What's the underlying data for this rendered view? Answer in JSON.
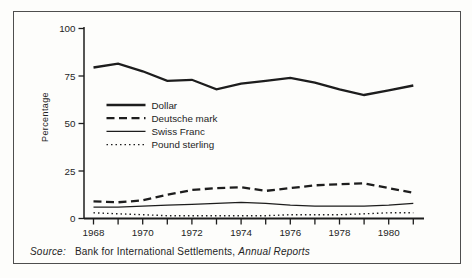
{
  "source": {
    "label": "Source:",
    "publisher": "Bank for International Settlements,",
    "publication": "Annual Reports"
  },
  "colors": {
    "ink": "#1d1d1d",
    "frame_border": "#4e4e4e",
    "paper": "#fdfdfb",
    "text": "#242424"
  },
  "chart_data": {
    "type": "line",
    "title": "",
    "xlabel": "",
    "ylabel": "Percentage",
    "ylim": [
      0,
      100
    ],
    "yticks": [
      0,
      25,
      50,
      75,
      100
    ],
    "x": [
      1968,
      1969,
      1970,
      1971,
      1972,
      1973,
      1974,
      1975,
      1976,
      1977,
      1978,
      1979,
      1980,
      1981
    ],
    "xtick_labels": [
      "1968",
      "1970",
      "1972",
      "1974",
      "1976",
      "1978",
      "1980"
    ],
    "xticks_labeled_years": [
      1968,
      1970,
      1972,
      1974,
      1976,
      1978,
      1980
    ],
    "xticks_minor_every": 1,
    "grid": false,
    "legend_position": "inside-left",
    "series": [
      {
        "name": "Dollar",
        "style": "solid-thick",
        "values": [
          79.5,
          81.5,
          77.5,
          72.5,
          73,
          68,
          71,
          72.5,
          74,
          71.5,
          68,
          65,
          67.5,
          70
        ]
      },
      {
        "name": "Deutsche mark",
        "style": "dashed-thick",
        "values": [
          9,
          8.5,
          9.5,
          12.5,
          15,
          16,
          16.5,
          14.5,
          16,
          17.5,
          18,
          18.5,
          16,
          13.5
        ]
      },
      {
        "name": "Swiss Franc",
        "style": "solid-thin",
        "values": [
          6,
          6,
          6.5,
          7,
          7.5,
          8,
          8.5,
          8,
          7,
          6.5,
          6.5,
          6.5,
          7,
          8
        ]
      },
      {
        "name": "Pound sterling",
        "style": "dotted",
        "values": [
          3,
          2.5,
          2,
          1.5,
          1.5,
          1.5,
          1.5,
          1.5,
          2,
          2,
          2,
          2.5,
          3,
          3
        ]
      }
    ]
  }
}
